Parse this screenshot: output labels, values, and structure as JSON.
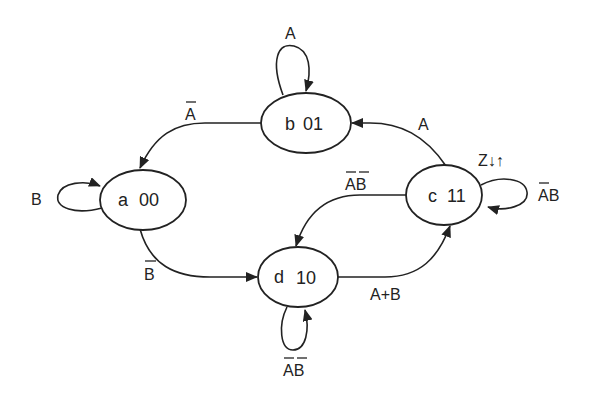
{
  "diagram": {
    "type": "state-machine",
    "colors": {
      "stroke": "#222222",
      "background": "#ffffff"
    },
    "states": [
      {
        "id": "a",
        "name": "a",
        "code": "00"
      },
      {
        "id": "b",
        "name": "b",
        "code": "01"
      },
      {
        "id": "c",
        "name": "c",
        "code": "11",
        "output": "Z↓↑"
      },
      {
        "id": "d",
        "name": "d",
        "code": "10"
      }
    ],
    "transitions": [
      {
        "from": "a",
        "to": "a",
        "label": "B"
      },
      {
        "from": "a",
        "to": "d",
        "label": "B̄",
        "label_base": "B"
      },
      {
        "from": "b",
        "to": "b",
        "label": "A"
      },
      {
        "from": "b",
        "to": "a",
        "label": "Ā",
        "label_base": "A"
      },
      {
        "from": "c",
        "to": "b",
        "label": "A"
      },
      {
        "from": "c",
        "to": "c",
        "label": "ĀB",
        "label_base": "AB"
      },
      {
        "from": "c",
        "to": "d",
        "label": "ĀB̄",
        "label_base": "AB"
      },
      {
        "from": "d",
        "to": "c",
        "label": "A+B"
      },
      {
        "from": "d",
        "to": "d",
        "label": "ĀB̄",
        "label_base": "AB"
      }
    ]
  }
}
